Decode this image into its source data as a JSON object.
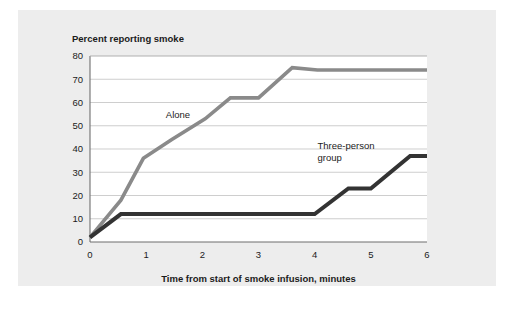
{
  "figure": {
    "panel_bg": "#ededed",
    "plot_bg": "#ffffff"
  },
  "chart_data": {
    "type": "line",
    "title": "Percent reporting smoke",
    "xlabel": "Time from start of smoke infusion, minutes",
    "ylabel": "Percent reporting smoke",
    "xlim": [
      0,
      6
    ],
    "ylim": [
      0,
      80
    ],
    "xticks": [
      0,
      1,
      2,
      3,
      4,
      5,
      6
    ],
    "xtick_labels": [
      "0",
      "1",
      "2",
      "3",
      "4",
      "5",
      "6"
    ],
    "yticks": [
      0,
      10,
      20,
      30,
      40,
      50,
      60,
      70,
      80
    ],
    "ytick_labels": [
      "0",
      "10",
      "20",
      "30",
      "40",
      "50",
      "60",
      "70",
      "80"
    ],
    "grid": true,
    "grid_axis": "y",
    "legend": "inline-annotations",
    "series": [
      {
        "name": "Alone",
        "color": "#8a8a8a",
        "width": 3.6,
        "label_x": 1.35,
        "label_y": 53.5,
        "label_lines": [
          "Alone"
        ],
        "x": [
          0.0,
          0.55,
          0.95,
          1.45,
          2.05,
          2.5,
          3.0,
          3.6,
          4.05,
          6.0
        ],
        "y": [
          2.0,
          18.0,
          36.0,
          44.0,
          53.0,
          62.0,
          62.0,
          75.0,
          74.0,
          74.0
        ]
      },
      {
        "name": "Three-person group",
        "color": "#333333",
        "width": 4.0,
        "label_x": 4.05,
        "label_y": 40.0,
        "label_lines": [
          "Three-person",
          "group"
        ],
        "x": [
          0.0,
          0.55,
          4.0,
          4.6,
          5.0,
          5.7,
          6.0
        ],
        "y": [
          2.0,
          12.0,
          12.0,
          23.0,
          23.0,
          37.0,
          37.0
        ]
      }
    ]
  }
}
